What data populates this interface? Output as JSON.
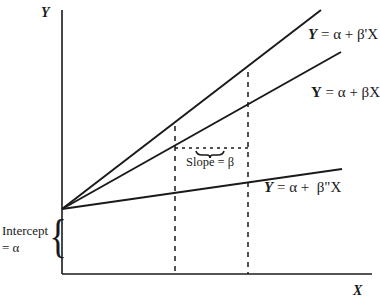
{
  "diagram": {
    "axes": {
      "y_label": "Y",
      "x_label": "X"
    },
    "lines": [
      {
        "id": "steep",
        "label_lhs": "Y",
        "label_rhs": "= α + β'X"
      },
      {
        "id": "base",
        "label_lhs": "Y",
        "label_rhs": "= α + βX"
      },
      {
        "id": "shallow",
        "label_lhs": "Y",
        "label_rhs": "= α +  β\"X"
      }
    ],
    "annotations": {
      "slope": "Slope = β",
      "intercept_line1": "Intercept",
      "intercept_line2": "= α",
      "brace": "{"
    },
    "colors": {
      "ink": "#1a1a1a",
      "background": "#ffffff"
    }
  }
}
